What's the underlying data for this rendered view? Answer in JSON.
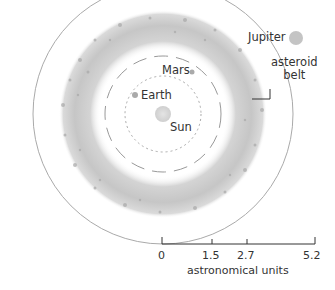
{
  "labels": {
    "jupiter": "Jupiter",
    "mars": "Mars",
    "earth": "Earth",
    "sun": "Sun",
    "asteroid_belt_line1": "asteroid",
    "asteroid_belt_line2": "belt"
  },
  "scale": {
    "ticks": [
      "0",
      "1.5",
      "2.7",
      "5.2"
    ],
    "unit_label": "astronomical units"
  },
  "colors": {
    "belt": "#b8b8b8",
    "orbit": "#999999",
    "sun": "#d8d8d8",
    "planet": "#b0b0b0"
  }
}
